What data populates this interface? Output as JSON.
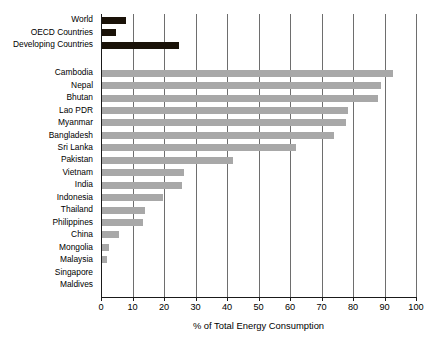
{
  "chart_data": {
    "type": "bar",
    "orientation": "horizontal",
    "title": "",
    "xlabel": "% of Total Energy Consumption",
    "ylabel": "",
    "xlim": [
      0,
      100
    ],
    "xticks": [
      0,
      10,
      20,
      30,
      40,
      50,
      60,
      70,
      80,
      90,
      100
    ],
    "grid": true,
    "legend": false,
    "groups": [
      {
        "name": "aggregates",
        "color": "#1a1208",
        "categories": [
          "World",
          "OECD Countries",
          "Developing Countries"
        ],
        "values": [
          7.5,
          4.5,
          24.5
        ]
      },
      {
        "name": "countries",
        "color": "#a8a8a8",
        "categories": [
          "Cambodia",
          "Nepal",
          "Bhutan",
          "Lao PDR",
          "Myanmar",
          "Bangladesh",
          "Sri Lanka",
          "Pakistan",
          "Vietnam",
          "India",
          "Indonesia",
          "Thailand",
          "Philippines",
          "China",
          "Mongolia",
          "Malaysia",
          "Singapore",
          "Maldives"
        ],
        "values": [
          92.5,
          88.5,
          87.5,
          78,
          77.5,
          73.5,
          61.5,
          41.5,
          26,
          25.5,
          19.5,
          13.5,
          13,
          5.5,
          2.2,
          1.5,
          0,
          0
        ]
      }
    ],
    "categories": [
      "World",
      "OECD Countries",
      "Developing Countries",
      "Cambodia",
      "Nepal",
      "Bhutan",
      "Lao PDR",
      "Myanmar",
      "Bangladesh",
      "Sri Lanka",
      "Pakistan",
      "Vietnam",
      "India",
      "Indonesia",
      "Thailand",
      "Philippines",
      "China",
      "Mongolia",
      "Malaysia",
      "Singapore",
      "Maldives"
    ],
    "values": [
      7.5,
      4.5,
      24.5,
      92.5,
      88.5,
      87.5,
      78,
      77.5,
      73.5,
      61.5,
      41.5,
      26,
      25.5,
      19.5,
      13.5,
      13,
      5.5,
      2.2,
      1.5,
      0,
      0
    ]
  },
  "axis": {
    "tick_labels": [
      "0",
      "10",
      "20",
      "30",
      "40",
      "50",
      "60",
      "70",
      "80",
      "90",
      "100"
    ],
    "title": "% of Total Energy Consumption"
  },
  "labels": {
    "world": "World",
    "oecd": "OECD Countries",
    "developing": "Developing Countries",
    "cambodia": "Cambodia",
    "nepal": "Nepal",
    "bhutan": "Bhutan",
    "lao_pdr": "Lao PDR",
    "myanmar": "Myanmar",
    "bangladesh": "Bangladesh",
    "sri_lanka": "Sri Lanka",
    "pakistan": "Pakistan",
    "vietnam": "Vietnam",
    "india": "India",
    "indonesia": "Indonesia",
    "thailand": "Thailand",
    "philippines": "Philippines",
    "china": "China",
    "mongolia": "Mongolia",
    "malaysia": "Malaysia",
    "singapore": "Singapore",
    "maldives": "Maldives"
  },
  "colors": {
    "aggregate_bar": "#1a1208",
    "country_bar": "#a8a8a8",
    "gridline": "#6e6e6e",
    "axis": "#1a1a1a",
    "background": "#ffffff"
  }
}
